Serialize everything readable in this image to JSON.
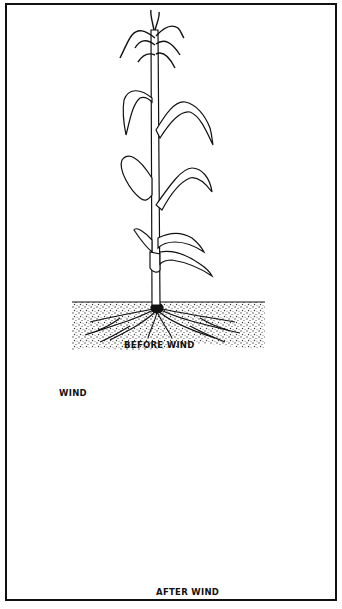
{
  "figure": {
    "type": "illustration",
    "panels": [
      {
        "id": "top",
        "label": "BEFORE WIND",
        "content": "upright corn plant with tassel, alternating leaves and root system in soil"
      },
      {
        "id": "bottom",
        "label": "AFTER WIND",
        "wind_label": "WIND",
        "arrows": 3,
        "arrow_direction": "right",
        "content": "corn plant lodged flat along the ground, roots partly pulled out of soil"
      }
    ],
    "colors": {
      "ink": "#111111",
      "paper": "#ffffff",
      "soil_stipple": "#444444"
    },
    "caption_fragment": ""
  }
}
